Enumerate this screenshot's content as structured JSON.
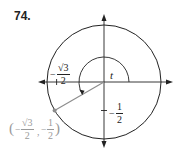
{
  "problem": {
    "number": "74."
  },
  "diagram": {
    "type": "unit-circle",
    "center": [
      104,
      82
    ],
    "radius": 57,
    "angle_label": "t",
    "angle_degrees": 210,
    "point": {
      "x": "-√3/2",
      "y": "-1/2"
    },
    "labels": {
      "x_tick": {
        "sign": "−",
        "num": "√3",
        "den": "2"
      },
      "y_tick": {
        "sign": "−",
        "num": "1",
        "den": "2"
      },
      "point_coord": {
        "open": "(",
        "x_sign": "−",
        "x_num": "√3",
        "x_den": "2",
        "sep": ",",
        "y_sign": "−",
        "y_num": "1",
        "y_den": "2",
        "close": ")"
      }
    },
    "colors": {
      "stroke": "#222222",
      "radius_line": "#8c8c8c",
      "point_label": "#9a9a9a"
    }
  }
}
